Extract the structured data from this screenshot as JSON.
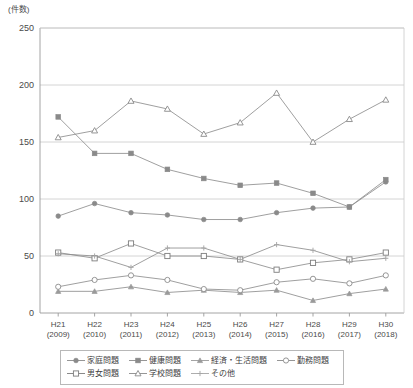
{
  "chart_data": {
    "type": "line",
    "title": "",
    "subtitle": "",
    "unit_label": "(件数)",
    "xlabel": "",
    "ylabel": "",
    "ylim": [
      0,
      250
    ],
    "ytick_step": 50,
    "yticks": [
      "0",
      "50",
      "100",
      "150",
      "200",
      "250"
    ],
    "grid": true,
    "legend_position": "bottom",
    "categories": [
      "H21\n(2009)",
      "H22\n(2010)",
      "H23\n(2011)",
      "H24\n(2012)",
      "H25\n(2013)",
      "H26\n(2014)",
      "H27\n(2015)",
      "H28\n(2016)",
      "H29\n(2017)",
      "H30\n(2018)"
    ],
    "categories_era": [
      "H21",
      "H22",
      "H23",
      "H24",
      "H25",
      "H26",
      "H27",
      "H28",
      "H29",
      "H30"
    ],
    "categories_year": [
      "(2009)",
      "(2010)",
      "(2011)",
      "(2012)",
      "(2013)",
      "(2014)",
      "(2015)",
      "(2016)",
      "(2017)",
      "(2018)"
    ],
    "series": [
      {
        "name": "家庭問題",
        "marker": "filled-circle",
        "color": "#8a8a8a",
        "values": [
          85,
          96,
          88,
          86,
          82,
          82,
          88,
          92,
          93,
          115
        ]
      },
      {
        "name": "健康問題",
        "marker": "filled-square",
        "color": "#8a8a8a",
        "values": [
          172,
          140,
          140,
          126,
          118,
          112,
          114,
          105,
          93,
          117
        ]
      },
      {
        "name": "経済・生活問題",
        "marker": "filled-triangle",
        "color": "#9a9a9a",
        "values": [
          19,
          19,
          23,
          18,
          20,
          18,
          20,
          11,
          17,
          21
        ]
      },
      {
        "name": "勤務問題",
        "marker": "open-circle",
        "color": "#8a8a8a",
        "values": [
          23,
          29,
          33,
          29,
          21,
          20,
          27,
          30,
          26,
          33
        ]
      },
      {
        "name": "男女問題",
        "marker": "open-square",
        "color": "#7d7d7d",
        "values": [
          53,
          48,
          61,
          50,
          50,
          47,
          38,
          44,
          47,
          53
        ]
      },
      {
        "name": "学校問題",
        "marker": "open-triangle",
        "color": "#8a8a8a",
        "values": [
          154,
          160,
          186,
          179,
          157,
          167,
          193,
          150,
          170,
          187
        ]
      },
      {
        "name": "その他",
        "marker": "plus",
        "color": "#a5a5a5",
        "values": [
          52,
          50,
          40,
          57,
          57,
          47,
          60,
          55,
          45,
          48
        ]
      }
    ]
  },
  "legend": {
    "row1": [
      "家庭問題",
      "健康問題",
      "経済・生活問題",
      "勤務問題"
    ],
    "row2": [
      "男女問題",
      "学校問題",
      "その他"
    ]
  }
}
